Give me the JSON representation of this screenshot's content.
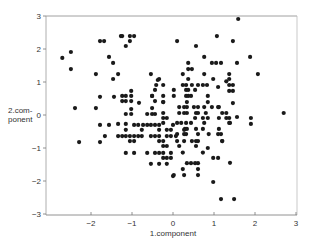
{
  "chart_data": {
    "type": "scatter",
    "title": "",
    "xlabel": "1.component",
    "ylabel": "2.com-ponent",
    "ylabel_lines": [
      "2.com-",
      "ponent"
    ],
    "xlim": [
      -3,
      3
    ],
    "ylim": [
      -3,
      3
    ],
    "xticks": [
      -2,
      -1,
      0,
      1,
      2,
      3
    ],
    "yticks": [
      -3,
      -2,
      -1,
      0,
      1,
      2,
      3
    ],
    "grid": false,
    "legend": null,
    "marker_color": "#1a1a1a",
    "points": [
      [
        -2.7,
        1.73
      ],
      [
        -2.49,
        1.91
      ],
      [
        -2.49,
        1.39
      ],
      [
        -1.78,
        2.24
      ],
      [
        -1.68,
        2.24
      ],
      [
        -1.27,
        2.39
      ],
      [
        -1.56,
        1.76
      ],
      [
        -1.46,
        1.58
      ],
      [
        -1.88,
        1.24
      ],
      [
        -1.46,
        1.09
      ],
      [
        -1.34,
        1.24
      ],
      [
        -1.24,
        2.39
      ],
      [
        -1.05,
        2.39
      ],
      [
        -0.95,
        2.39
      ],
      [
        -1.05,
        2.24
      ],
      [
        -1.15,
        2.09
      ],
      [
        0.1,
        2.24
      ],
      [
        0.56,
        2.09
      ],
      [
        0.76,
        1.76
      ],
      [
        0.37,
        1.58
      ],
      [
        0.37,
        1.39
      ],
      [
        0.46,
        1.39
      ],
      [
        0.24,
        1.24
      ],
      [
        -0.54,
        1.24
      ],
      [
        -0.34,
        1.09
      ],
      [
        0.37,
        1.09
      ],
      [
        -0.41,
        0.91
      ],
      [
        0.24,
        0.91
      ],
      [
        0.46,
        0.91
      ],
      [
        0.73,
        0.91
      ],
      [
        0.83,
        0.91
      ],
      [
        1.59,
        2.91
      ],
      [
        1.07,
        2.39
      ],
      [
        1.46,
        2.24
      ],
      [
        1.88,
        1.76
      ],
      [
        0.95,
        1.58
      ],
      [
        1.05,
        1.58
      ],
      [
        1.17,
        1.58
      ],
      [
        1.56,
        1.58
      ],
      [
        0.76,
        1.24
      ],
      [
        1.37,
        1.24
      ],
      [
        2.07,
        1.24
      ],
      [
        0.98,
        1.09
      ],
      [
        1.37,
        1.09
      ],
      [
        -0.37,
        1.06
      ],
      [
        -0.44,
        0.76
      ],
      [
        -1.78,
        0.55
      ],
      [
        -1.44,
        0.55
      ],
      [
        -1.24,
        0.58
      ],
      [
        -1.15,
        0.58
      ],
      [
        -1.02,
        0.58
      ],
      [
        -1.02,
        0.73
      ],
      [
        -0.51,
        0.58
      ],
      [
        -0.24,
        0.58
      ],
      [
        -1.24,
        0.42
      ],
      [
        -1.15,
        0.42
      ],
      [
        -1.02,
        0.42
      ],
      [
        -0.83,
        0.37
      ],
      [
        -0.44,
        0.42
      ],
      [
        -0.24,
        0.39
      ],
      [
        -0.51,
        0.21
      ],
      [
        -1.02,
        0.18
      ],
      [
        -1.15,
        0.03
      ],
      [
        -1.02,
        0.03
      ],
      [
        -0.63,
        0.03
      ],
      [
        -0.51,
        0.03
      ],
      [
        -0.44,
        0.03
      ],
      [
        -2.39,
        0.21
      ],
      [
        -1.88,
        0.21
      ],
      [
        -1.78,
        -0.3
      ],
      [
        -1.56,
        -0.3
      ],
      [
        -1.34,
        -0.27
      ],
      [
        -1.15,
        -0.27
      ],
      [
        -0.95,
        -0.3
      ],
      [
        -0.85,
        -0.3
      ],
      [
        -0.73,
        -0.3
      ],
      [
        -0.63,
        -0.3
      ],
      [
        -0.54,
        -0.3
      ],
      [
        -0.44,
        -0.3
      ],
      [
        -0.34,
        -0.3
      ],
      [
        0.0,
        -0.3
      ],
      [
        -1.15,
        -0.45
      ],
      [
        -0.76,
        -0.45
      ],
      [
        -0.34,
        -0.45
      ],
      [
        -0.15,
        -0.45
      ],
      [
        -0.05,
        -0.45
      ],
      [
        0.27,
        -0.45
      ],
      [
        -1.66,
        -0.64
      ],
      [
        -1.34,
        -0.64
      ],
      [
        -1.24,
        -0.64
      ],
      [
        -1.15,
        -0.64
      ],
      [
        -1.05,
        -0.64
      ],
      [
        -0.95,
        -0.64
      ],
      [
        -0.85,
        -0.64
      ],
      [
        -0.76,
        -0.64
      ],
      [
        -0.54,
        -0.64
      ],
      [
        -0.44,
        -0.64
      ],
      [
        -0.34,
        -0.64
      ],
      [
        -0.15,
        -0.64
      ],
      [
        -0.05,
        -0.64
      ],
      [
        0.07,
        -0.64
      ],
      [
        -2.29,
        -0.82
      ],
      [
        -1.78,
        -0.82
      ],
      [
        -1.05,
        -0.79
      ],
      [
        -0.95,
        -0.79
      ],
      [
        -0.34,
        -0.79
      ],
      [
        -0.24,
        -0.79
      ],
      [
        -0.24,
        -0.94
      ],
      [
        -0.15,
        -0.94
      ],
      [
        -1.15,
        -1.15
      ],
      [
        -0.95,
        -1.15
      ],
      [
        -0.63,
        -1.15
      ],
      [
        -0.44,
        -1.15
      ],
      [
        -0.34,
        -1.15
      ],
      [
        -0.24,
        -1.15
      ],
      [
        -0.05,
        -1.15
      ],
      [
        -0.24,
        -1.3
      ],
      [
        -0.15,
        -1.3
      ],
      [
        -0.05,
        -1.3
      ],
      [
        -0.54,
        -1.48
      ],
      [
        -0.34,
        -1.48
      ],
      [
        -0.15,
        -1.48
      ],
      [
        0.0,
        -1.85
      ],
      [
        -0.24,
        0.91
      ],
      [
        0.32,
        0.91
      ],
      [
        0.61,
        0.91
      ],
      [
        0.02,
        0.76
      ],
      [
        0.32,
        0.76
      ],
      [
        0.37,
        0.76
      ],
      [
        0.54,
        0.76
      ],
      [
        0.32,
        0.58
      ],
      [
        0.37,
        0.58
      ],
      [
        -0.51,
        0.58
      ],
      [
        0.02,
        0.58
      ],
      [
        0.44,
        0.58
      ],
      [
        0.85,
        0.58
      ],
      [
        0.85,
        0.39
      ],
      [
        0.34,
        0.39
      ],
      [
        -0.24,
        0.39
      ],
      [
        0.15,
        0.24
      ],
      [
        0.27,
        0.24
      ],
      [
        0.34,
        0.24
      ],
      [
        0.51,
        0.24
      ],
      [
        0.61,
        0.24
      ],
      [
        0.76,
        0.24
      ],
      [
        0.95,
        0.24
      ],
      [
        1.12,
        0.24
      ],
      [
        -0.24,
        0.06
      ],
      [
        0.15,
        0.06
      ],
      [
        0.27,
        0.06
      ],
      [
        0.34,
        0.06
      ],
      [
        0.56,
        0.06
      ],
      [
        0.61,
        0.06
      ],
      [
        0.8,
        0.06
      ],
      [
        1.3,
        0.06
      ],
      [
        -0.24,
        -0.09
      ],
      [
        -0.15,
        -0.09
      ],
      [
        0.54,
        -0.09
      ],
      [
        0.73,
        -0.09
      ],
      [
        0.85,
        -0.09
      ],
      [
        1.12,
        -0.09
      ],
      [
        1.56,
        -0.06
      ],
      [
        -0.24,
        -0.24
      ],
      [
        0.1,
        -0.24
      ],
      [
        0.2,
        -0.24
      ],
      [
        0.32,
        -0.24
      ],
      [
        0.44,
        -0.24
      ],
      [
        0.76,
        -0.24
      ],
      [
        1.39,
        -0.24
      ],
      [
        0.29,
        -0.42
      ],
      [
        0.34,
        -0.42
      ],
      [
        0.56,
        -0.42
      ],
      [
        0.73,
        -0.42
      ],
      [
        1.12,
        -0.42
      ],
      [
        0.1,
        -0.58
      ],
      [
        0.27,
        -0.58
      ],
      [
        0.32,
        -0.58
      ],
      [
        0.61,
        -0.58
      ],
      [
        0.87,
        -0.58
      ],
      [
        1.1,
        -0.58
      ],
      [
        1.17,
        -0.58
      ],
      [
        0.1,
        -0.79
      ],
      [
        0.27,
        -0.79
      ],
      [
        0.46,
        -0.79
      ],
      [
        0.56,
        -0.79
      ],
      [
        0.61,
        -0.79
      ],
      [
        1.2,
        -0.79
      ],
      [
        0.15,
        -0.94
      ],
      [
        0.56,
        -0.94
      ],
      [
        0.24,
        -1.14
      ],
      [
        0.73,
        -1.14
      ],
      [
        0.98,
        -1.3
      ],
      [
        1.1,
        -1.3
      ],
      [
        0.85,
        -1.0
      ],
      [
        1.39,
        -1.45
      ],
      [
        0.34,
        -1.46
      ],
      [
        0.44,
        -1.46
      ],
      [
        0.54,
        -1.46
      ],
      [
        0.61,
        -1.46
      ],
      [
        0.24,
        -1.64
      ],
      [
        0.61,
        -1.64
      ],
      [
        0.02,
        -1.82
      ],
      [
        0.27,
        -1.82
      ],
      [
        0.61,
        -1.82
      ],
      [
        0.98,
        -2.03
      ],
      [
        1.17,
        -2.55
      ],
      [
        1.49,
        -2.55
      ],
      [
        2.7,
        0.06
      ],
      [
        1.3,
        1.02
      ],
      [
        1.37,
        0.91
      ],
      [
        1.46,
        0.91
      ],
      [
        1.37,
        0.73
      ],
      [
        1.46,
        0.73
      ],
      [
        1.1,
        0.85
      ],
      [
        1.46,
        0.36
      ],
      [
        1.1,
        0.24
      ],
      [
        1.2,
        0.06
      ],
      [
        1.3,
        -0.09
      ],
      [
        1.37,
        -0.09
      ],
      [
        1.9,
        -0.09
      ],
      [
        1.37,
        -0.24
      ],
      [
        1.9,
        -0.27
      ],
      [
        1.2,
        -0.79
      ]
    ]
  }
}
